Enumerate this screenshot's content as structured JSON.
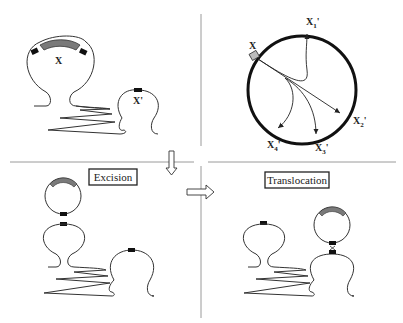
{
  "diagram": {
    "panels": {
      "top_left": {
        "donor_locus_label": "X",
        "target_locus_label": "X'"
      },
      "top_right": {
        "source_label": "X",
        "target_labels": [
          {
            "main": "X",
            "sub": "1",
            "prime": "'"
          },
          {
            "main": "X",
            "sub": "2",
            "prime": "'"
          },
          {
            "main": "X",
            "sub": "3",
            "prime": "'"
          },
          {
            "main": "X",
            "sub": "4",
            "prime": "'"
          }
        ]
      },
      "bottom_left": {
        "step_label": "Excision"
      },
      "bottom_right": {
        "step_label": "Translocation"
      }
    },
    "colors": {
      "line": "#333333",
      "thick_circle": "#111111",
      "shaded_segment": "#7a7a7a",
      "site_marker": "#111111",
      "divider": "#9a9a9a"
    }
  }
}
